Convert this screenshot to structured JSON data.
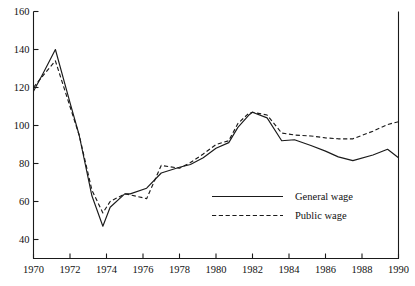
{
  "chart_data": {
    "type": "line",
    "title": "",
    "subtitle": "",
    "xlabel": "",
    "ylabel": "",
    "xlim": [
      1970,
      1990
    ],
    "ylim": [
      30,
      160
    ],
    "grid": false,
    "legend_position": "center-right",
    "y_ticks": [
      40,
      60,
      80,
      100,
      120,
      140,
      160
    ],
    "y_tick_labels": [
      "40",
      "60",
      "80",
      "100",
      "120",
      "140",
      "160"
    ],
    "x_ticks": [
      1970,
      1972,
      1974,
      1976,
      1978,
      1980,
      1982,
      1984,
      1986,
      1988,
      1990
    ],
    "x_tick_labels": [
      "1970",
      "1972",
      "1974",
      "1976",
      "1978",
      "1980",
      "1982",
      "1984",
      "1986",
      "1988",
      "1990"
    ],
    "x": [
      1970.0,
      1970.5,
      1971.2,
      1972.0,
      1972.5,
      1973.2,
      1973.8,
      1974.2,
      1975.0,
      1975.3,
      1976.2,
      1977.0,
      1978.0,
      1978.6,
      1979.3,
      1980.0,
      1980.7,
      1981.2,
      1981.8,
      1982.0,
      1982.8,
      1983.6,
      1984.3,
      1985.2,
      1986.0,
      1986.7,
      1987.5,
      1988.6,
      1989.4,
      1990.0
    ],
    "series": [
      {
        "name": "General wage",
        "style": "solid",
        "values": [
          118.0,
          127.0,
          140.0,
          112.0,
          95.0,
          63.0,
          47.0,
          57.0,
          64.0,
          64.0,
          67.0,
          75.0,
          78.0,
          79.5,
          83.0,
          88.0,
          91.0,
          99.0,
          105.5,
          107.0,
          104.0,
          92.0,
          92.5,
          89.5,
          86.5,
          83.5,
          81.5,
          84.5,
          87.5,
          83.0
        ]
      },
      {
        "name": "Public wage",
        "style": "dashed",
        "values": [
          120.0,
          126.0,
          134.0,
          110.0,
          95.0,
          66.0,
          54.0,
          60.0,
          64.0,
          63.5,
          61.5,
          79.0,
          77.5,
          80.5,
          85.0,
          90.0,
          92.0,
          101.0,
          106.5,
          107.0,
          105.5,
          96.0,
          95.0,
          94.5,
          93.5,
          93.0,
          93.0,
          97.0,
          100.5,
          102.0
        ]
      }
    ],
    "legend": [
      {
        "label": "General wage",
        "style": "solid"
      },
      {
        "label": "Public wage",
        "style": "dashed"
      }
    ]
  }
}
